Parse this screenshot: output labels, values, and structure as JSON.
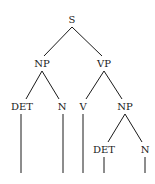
{
  "diagram": {
    "type": "syntax-tree",
    "colors": {
      "line": "#1a1a1a",
      "text": "#1a1a1a",
      "background": "#ffffff"
    },
    "nodes": [
      {
        "id": "s",
        "label": "S",
        "x": 72,
        "y": 20
      },
      {
        "id": "np1",
        "label": "NP",
        "x": 42,
        "y": 64
      },
      {
        "id": "vp",
        "label": "VP",
        "x": 104,
        "y": 64
      },
      {
        "id": "det1",
        "label": "DET",
        "x": 22,
        "y": 107
      },
      {
        "id": "n1",
        "label": "N",
        "x": 62,
        "y": 107
      },
      {
        "id": "v",
        "label": "V",
        "x": 83,
        "y": 107
      },
      {
        "id": "np2",
        "label": "NP",
        "x": 125,
        "y": 107
      },
      {
        "id": "det2",
        "label": "DET",
        "x": 104,
        "y": 150
      },
      {
        "id": "n2",
        "label": "N",
        "x": 145,
        "y": 150
      }
    ],
    "edges": [
      [
        "s",
        "np1"
      ],
      [
        "s",
        "vp"
      ],
      [
        "np1",
        "det1"
      ],
      [
        "np1",
        "n1"
      ],
      [
        "vp",
        "v"
      ],
      [
        "vp",
        "np2"
      ],
      [
        "np2",
        "det2"
      ],
      [
        "np2",
        "n2"
      ]
    ],
    "leaf_stems": [
      "det1",
      "n1",
      "v",
      "det2",
      "n2"
    ]
  }
}
